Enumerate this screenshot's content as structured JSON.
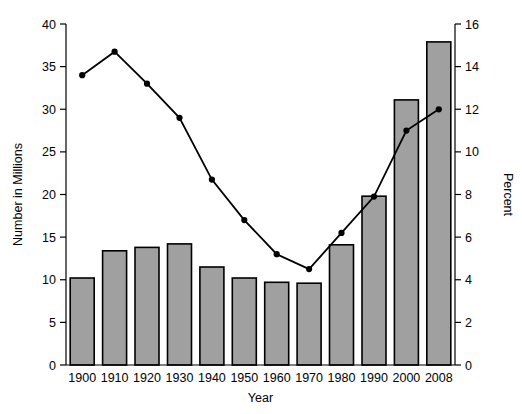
{
  "chart_data": {
    "type": "bar",
    "title": "",
    "subtitle": "",
    "xlabel": "Year",
    "ylabel": "Number in Millions",
    "y2label": "Percent",
    "categories": [
      "1900",
      "1910",
      "1920",
      "1930",
      "1940",
      "1950",
      "1960",
      "1970",
      "1980",
      "1990",
      "2000",
      "2008"
    ],
    "ylim": [
      0,
      40
    ],
    "yticks": [
      0,
      5,
      10,
      15,
      20,
      25,
      30,
      35,
      40
    ],
    "y2lim": [
      0,
      16
    ],
    "y2ticks": [
      0,
      2,
      4,
      6,
      8,
      10,
      12,
      14,
      16
    ],
    "grid": false,
    "legend": "none",
    "series": [
      {
        "name": "Number in Millions",
        "type": "bar",
        "axis": "left",
        "color": "#a0a0a0",
        "edge_color": "#000000",
        "values": [
          10.2,
          13.4,
          13.8,
          14.2,
          11.5,
          10.2,
          9.7,
          9.6,
          14.1,
          19.8,
          31.1,
          37.9
        ]
      },
      {
        "name": "Percent",
        "type": "line",
        "axis": "right",
        "color": "#000000",
        "marker": "circle",
        "values": [
          13.6,
          14.7,
          13.2,
          11.6,
          8.7,
          6.8,
          5.2,
          4.5,
          6.2,
          7.9,
          11.0,
          12.0
        ]
      }
    ]
  },
  "axes": {
    "x_title": "Year",
    "y_left_title": "Number in Millions",
    "y_right_title": "Percent",
    "y_left_ticks": [
      "0",
      "5",
      "10",
      "15",
      "20",
      "25",
      "30",
      "35",
      "40"
    ],
    "y_right_ticks": [
      "0",
      "2",
      "4",
      "6",
      "8",
      "10",
      "12",
      "14",
      "16"
    ],
    "x_ticks": [
      "1900",
      "1910",
      "1920",
      "1930",
      "1940",
      "1950",
      "1960",
      "1970",
      "1980",
      "1990",
      "2000",
      "2008"
    ]
  }
}
